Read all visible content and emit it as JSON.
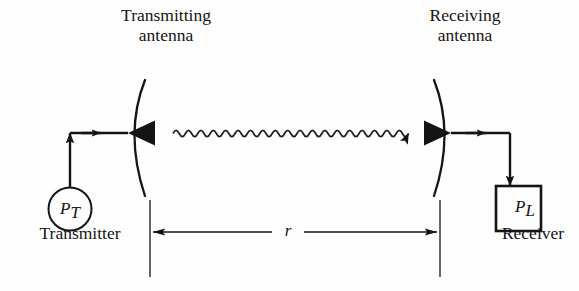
{
  "figure": {
    "background_color": "#fefefe",
    "ink_color": "#141414"
  },
  "labels": {
    "transmitting_antenna_line1": "Transmitting",
    "transmitting_antenna_line2": "antenna",
    "receiving_antenna_line1": "Receiving",
    "receiving_antenna_line2": "antenna",
    "transmitter": "Transmitter",
    "receiver": "Receiver"
  },
  "symbols": {
    "transmit_power_base": "P",
    "transmit_power_sub": "T",
    "load_power_base": "P",
    "load_power_sub": "L",
    "distance": "r"
  },
  "elements": {
    "wave_arrow_name": "propagating-wave",
    "wave_cycles": 25,
    "dimension_label": "r",
    "transmitter_source_shape": "circle",
    "receiver_load_shape": "square"
  }
}
